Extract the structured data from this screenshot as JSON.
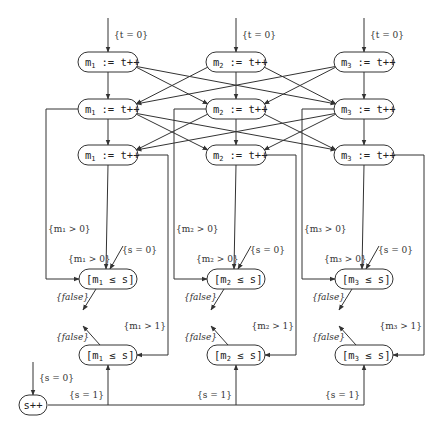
{
  "diagram": {
    "entry_label": "{t = 0}",
    "assign_nodes": [
      {
        "row": 1,
        "col": 1,
        "var": "m",
        "sub": "1",
        "op": ":= t++"
      },
      {
        "row": 1,
        "col": 2,
        "var": "m",
        "sub": "2",
        "op": ":= t++"
      },
      {
        "row": 1,
        "col": 3,
        "var": "m",
        "sub": "3",
        "op": ":= t++"
      },
      {
        "row": 2,
        "col": 1,
        "var": "m",
        "sub": "1",
        "op": ":= t++"
      },
      {
        "row": 2,
        "col": 2,
        "var": "m",
        "sub": "2",
        "op": ":= t++"
      },
      {
        "row": 2,
        "col": 3,
        "var": "m",
        "sub": "3",
        "op": ":= t++"
      },
      {
        "row": 3,
        "col": 1,
        "var": "m",
        "sub": "1",
        "op": ":= t++"
      },
      {
        "row": 3,
        "col": 2,
        "var": "m",
        "sub": "2",
        "op": ":= t++"
      },
      {
        "row": 3,
        "col": 3,
        "var": "m",
        "sub": "3",
        "op": ":= t++"
      }
    ],
    "check_nodes": [
      {
        "row": "A",
        "col": 1,
        "text": "[m",
        "sub": "1",
        "rest": " ≤ s]"
      },
      {
        "row": "A",
        "col": 2,
        "text": "[m",
        "sub": "2",
        "rest": " ≤ s]"
      },
      {
        "row": "A",
        "col": 3,
        "text": "[m",
        "sub": "3",
        "rest": " ≤ s]"
      },
      {
        "row": "B",
        "col": 1,
        "text": "[m",
        "sub": "1",
        "rest": " ≤ s]"
      },
      {
        "row": "B",
        "col": 2,
        "text": "[m",
        "sub": "2",
        "rest": " ≤ s]"
      },
      {
        "row": "B",
        "col": 3,
        "text": "[m",
        "sub": "3",
        "rest": " ≤ s]"
      }
    ],
    "counter_node": "s++",
    "labels": {
      "m_gt_0": [
        "{m₁ > 0}",
        "{m₂ > 0}",
        "{m₃ > 0}"
      ],
      "m_gt_1": [
        "{m₁ > 1}",
        "{m₂ > 1}",
        "{m₃ > 1}"
      ],
      "s_eq_0": "{s = 0}",
      "s_eq_1": "{s = 1}",
      "false": "{false}"
    }
  }
}
